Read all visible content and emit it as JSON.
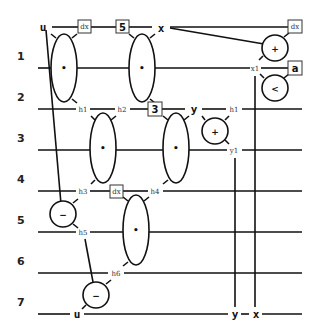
{
  "diagram": {
    "row_labels": [
      "1",
      "2",
      "3",
      "4",
      "5",
      "6",
      "7"
    ],
    "top_labels": {
      "u": "u",
      "x": "x",
      "y": "y"
    },
    "wire_labels": {
      "h1_left": "h1",
      "h2": "h2",
      "h1_right": "h1",
      "x1": "x1",
      "y1": "y1",
      "h3": "h3",
      "h4": "h4",
      "h5": "h5",
      "h6": "h6"
    },
    "boxes": {
      "dx_top_left": "dx",
      "five": "5",
      "dx_top_right": "dx",
      "a": "a",
      "three": "3",
      "dx_mid": "dx"
    },
    "ellipse_ops": [
      "•",
      "•",
      "•",
      "•",
      "•"
    ],
    "circle_ops": {
      "plus_top": "+",
      "less": "<",
      "plus_mid": "+",
      "minus_left": "−",
      "minus_bottom": "−"
    },
    "bottom_labels": {
      "u": "u",
      "y": "y",
      "x": "x"
    }
  }
}
